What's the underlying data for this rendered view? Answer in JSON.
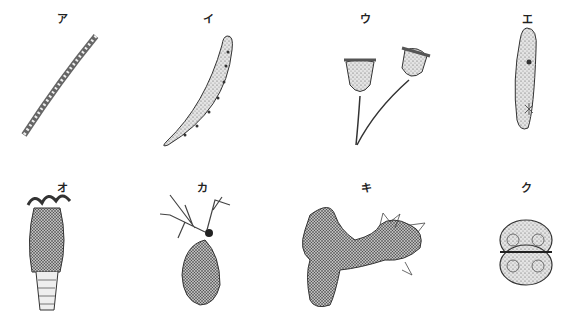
{
  "figure": {
    "organisms": [
      {
        "label": "ア",
        "name": "filamentous-alga"
      },
      {
        "label": "イ",
        "name": "closterium"
      },
      {
        "label": "ウ",
        "name": "vorticella"
      },
      {
        "label": "エ",
        "name": "paramecium"
      },
      {
        "label": "オ",
        "name": "rotifer"
      },
      {
        "label": "カ",
        "name": "daphnia"
      },
      {
        "label": "キ",
        "name": "amoeba"
      },
      {
        "label": "ク",
        "name": "cosmarium"
      }
    ],
    "colors": {
      "ink": "#333333",
      "fill": "#d8d8d8",
      "background": "#ffffff"
    }
  }
}
